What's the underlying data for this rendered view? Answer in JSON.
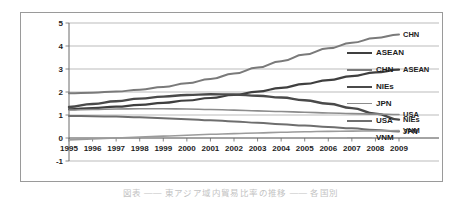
{
  "chart_data": {
    "type": "line",
    "title": "",
    "xlabel": "",
    "ylabel": "",
    "x": [
      1995,
      1996,
      1997,
      1998,
      1999,
      2000,
      2001,
      2002,
      2003,
      2004,
      2005,
      2006,
      2007,
      2008,
      2009
    ],
    "xlim": [
      1995,
      2009
    ],
    "ylim": [
      -1,
      5
    ],
    "yticks": [
      -1,
      0,
      1,
      2,
      3,
      4,
      5
    ],
    "xticks": [
      "1995",
      "1996",
      "1997",
      "1998",
      "1999",
      "2000",
      "2001",
      "2002",
      "2003",
      "2004",
      "2005",
      "2006",
      "2007",
      "2008",
      "2009"
    ],
    "grid": true,
    "legend_position": "right",
    "series": [
      {
        "name": "ASEAN",
        "color": "#3f3f3f",
        "width": 2.2,
        "end_label": "ASEAN",
        "values": [
          1.25,
          1.3,
          1.36,
          1.44,
          1.53,
          1.63,
          1.74,
          1.87,
          2.02,
          2.18,
          2.35,
          2.52,
          2.69,
          2.85,
          2.97
        ]
      },
      {
        "name": "CHN",
        "color": "#7a7a7a",
        "width": 2.0,
        "end_label": "CHN",
        "values": [
          1.95,
          1.97,
          2.02,
          2.1,
          2.22,
          2.38,
          2.57,
          2.8,
          3.06,
          3.34,
          3.63,
          3.9,
          4.14,
          4.35,
          4.5
        ]
      },
      {
        "name": "NIEs",
        "color": "#4a4a4a",
        "width": 2.4,
        "end_label": "NIEs",
        "values": [
          1.35,
          1.48,
          1.6,
          1.71,
          1.8,
          1.87,
          1.9,
          1.89,
          1.84,
          1.76,
          1.64,
          1.49,
          1.3,
          1.06,
          0.8
        ]
      },
      {
        "name": "JPN",
        "color": "#8c8c8c",
        "width": 1.6,
        "end_label": "JPN",
        "values": [
          1.22,
          1.24,
          1.26,
          1.27,
          1.27,
          1.26,
          1.24,
          1.21,
          1.18,
          1.15,
          1.12,
          1.09,
          1.06,
          1.04,
          1.02
        ]
      },
      {
        "name": "USA",
        "color": "#6e6e6e",
        "width": 2.0,
        "end_label": "USA",
        "values": [
          0.96,
          0.95,
          0.93,
          0.9,
          0.86,
          0.82,
          0.77,
          0.72,
          0.66,
          0.6,
          0.54,
          0.48,
          0.42,
          0.35,
          0.28
        ]
      },
      {
        "name": "VNM",
        "color": "#9b9b9b",
        "width": 1.6,
        "end_label": "VNM",
        "values": [
          -0.08,
          -0.04,
          0.0,
          0.04,
          0.08,
          0.12,
          0.16,
          0.19,
          0.22,
          0.25,
          0.27,
          0.29,
          0.3,
          0.31,
          0.32
        ]
      }
    ],
    "inline_end_labels": [
      {
        "text": "CHN",
        "value": 4.5
      },
      {
        "text": "ASEAN",
        "value": 2.97
      },
      {
        "text": "USA",
        "value": 1.02
      },
      {
        "text": "NIEs",
        "value": 0.8
      },
      {
        "text": "VNM",
        "value": 0.32
      },
      {
        "text": "JPN",
        "value": 0.28
      }
    ]
  },
  "legend": {
    "items": [
      {
        "label": "ASEAN",
        "color": "#3f3f3f",
        "width": 2.2
      },
      {
        "label": "CHN",
        "color": "#7a7a7a",
        "width": 2.0
      },
      {
        "label": "NIEs",
        "color": "#4a4a4a",
        "width": 2.4
      },
      {
        "label": "JPN",
        "color": "#8c8c8c",
        "width": 1.6
      },
      {
        "label": "USA",
        "color": "#6e6e6e",
        "width": 2.0
      },
      {
        "label": "VNM",
        "color": "#9b9b9b",
        "width": 1.6
      }
    ]
  },
  "caption": {
    "text": "図表 ――  東アジア域内貿易比率の推移  ――  各国別"
  },
  "colors": {
    "frame": "#9a9a9a",
    "grid": "#a9a9a9",
    "axis": "#6b6b6b",
    "text": "#1d1d1d",
    "background": "#ffffff"
  }
}
